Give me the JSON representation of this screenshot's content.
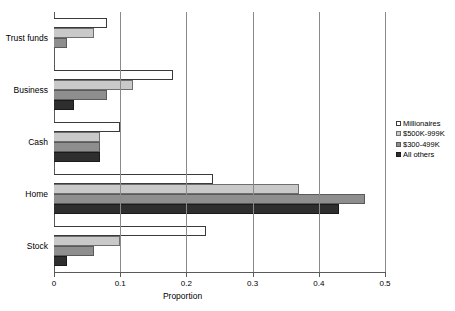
{
  "chart_data": {
    "type": "bar",
    "orientation": "horizontal",
    "title": "",
    "xlabel": "Proportion",
    "ylabel": "",
    "xlim": [
      0,
      0.5
    ],
    "xticks": [
      "0",
      "0.1",
      "0.2",
      "0.3",
      "0.4",
      "0.5"
    ],
    "xtick_values": [
      0,
      0.1,
      0.2,
      0.3,
      0.4,
      0.5
    ],
    "grid": "vertical",
    "legend_position": "right",
    "categories": [
      "Trust funds",
      "Business",
      "Cash",
      "Home",
      "Stock"
    ],
    "series": [
      {
        "name": "Millionaires",
        "color": "#ffffff",
        "values": [
          0.08,
          0.18,
          0.1,
          0.24,
          0.23
        ]
      },
      {
        "name": "$500K-999K",
        "color": "#c9c9c9",
        "values": [
          0.06,
          0.12,
          0.07,
          0.37,
          0.1
        ]
      },
      {
        "name": "$300-499K",
        "color": "#8e8e8e",
        "values": [
          0.02,
          0.08,
          0.07,
          0.47,
          0.06
        ]
      },
      {
        "name": "All others",
        "color": "#2e2e2e",
        "values": [
          0.0,
          0.03,
          0.07,
          0.43,
          0.02
        ]
      }
    ]
  },
  "legend": {
    "items": [
      {
        "label": "Millionaires"
      },
      {
        "label": "$500K-999K"
      },
      {
        "label": "$300-499K"
      },
      {
        "label": "All others"
      }
    ]
  }
}
